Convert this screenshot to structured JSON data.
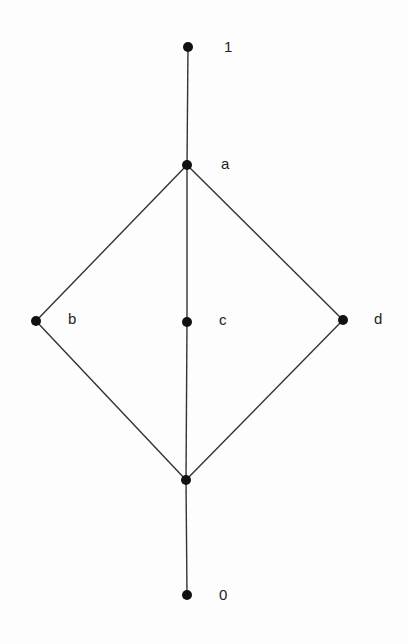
{
  "diagram": {
    "type": "hasse-diagram",
    "nodes": [
      {
        "id": "top",
        "label": "1",
        "x": 188,
        "y": 47,
        "lx": 224,
        "ly": 39
      },
      {
        "id": "a",
        "label": "a",
        "x": 187,
        "y": 165,
        "lx": 221,
        "ly": 156
      },
      {
        "id": "b",
        "label": "b",
        "x": 36,
        "y": 321,
        "lx": 68,
        "ly": 311
      },
      {
        "id": "c",
        "label": "c",
        "x": 187,
        "y": 322,
        "lx": 219,
        "ly": 312
      },
      {
        "id": "d",
        "label": "d",
        "x": 343,
        "y": 320,
        "lx": 374,
        "ly": 311
      },
      {
        "id": "mid",
        "label": "",
        "x": 186,
        "y": 480,
        "lx": 0,
        "ly": 0
      },
      {
        "id": "bottom",
        "label": "0",
        "x": 187,
        "y": 595,
        "lx": 219,
        "ly": 587
      }
    ],
    "edges": [
      [
        "top",
        "a"
      ],
      [
        "a",
        "b"
      ],
      [
        "a",
        "c"
      ],
      [
        "a",
        "d"
      ],
      [
        "b",
        "mid"
      ],
      [
        "c",
        "mid"
      ],
      [
        "d",
        "mid"
      ],
      [
        "mid",
        "bottom"
      ]
    ],
    "colors": {
      "line": "#333333",
      "node": "#111111"
    }
  }
}
